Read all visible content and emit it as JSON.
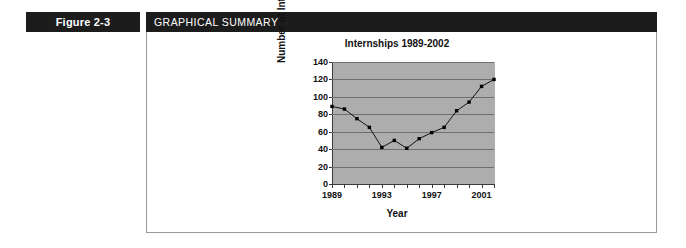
{
  "figure": {
    "tab_label": "Figure 2-3",
    "banner_label": "GRAPHICAL SUMMARY"
  },
  "colors": {
    "banner_background": "#1c1c1c",
    "banner_text": "#ffffff",
    "frame_border": "#9a9a9a",
    "plot_background": "#adadad",
    "gridline": "#6f6f6f",
    "axis": "#3a3a3a",
    "series_marker": "#000000",
    "page_background": "#ffffff"
  },
  "chart_data": {
    "type": "line",
    "title": "Internships 1989-2002",
    "xlabel": "Year",
    "ylabel": "Number of Interns",
    "x": [
      1989,
      1990,
      1991,
      1992,
      1993,
      1994,
      1995,
      1996,
      1997,
      1998,
      1999,
      2000,
      2001,
      2002
    ],
    "values": [
      89,
      86,
      75,
      65,
      42,
      50,
      41,
      52,
      59,
      65,
      84,
      94,
      112,
      120
    ],
    "series": [
      {
        "name": "Number of Interns",
        "values": [
          89,
          86,
          75,
          65,
          42,
          50,
          41,
          52,
          59,
          65,
          84,
          94,
          112,
          120
        ]
      }
    ],
    "xlim": [
      1989,
      2002
    ],
    "ylim": [
      0,
      140
    ],
    "ytick_labels": [
      "0",
      "20",
      "40",
      "60",
      "80",
      "100",
      "120",
      "140"
    ],
    "ytick_values": [
      0,
      20,
      40,
      60,
      80,
      100,
      120,
      140
    ],
    "xtick_labels": [
      "1989",
      "1993",
      "1997",
      "2001"
    ],
    "xtick_values": [
      1989,
      1993,
      1997,
      2001
    ],
    "grid": true,
    "legend": "none",
    "markers": "filled-square"
  }
}
